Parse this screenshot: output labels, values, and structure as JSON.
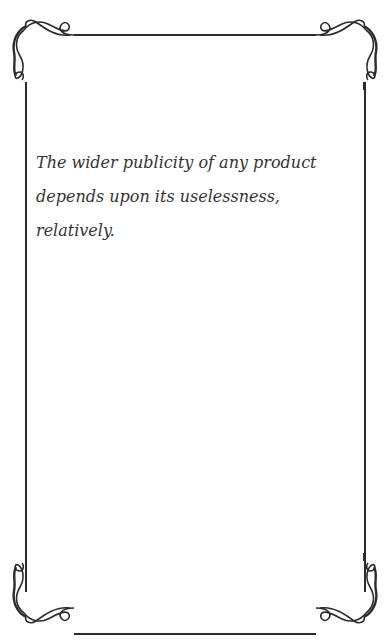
{
  "card": {
    "quote": "The wider publicity of any product depends upon its uselessness, relatively."
  },
  "colors": {
    "background": "#ffffff",
    "frame": "#2b2b2b",
    "text": "#333333"
  }
}
